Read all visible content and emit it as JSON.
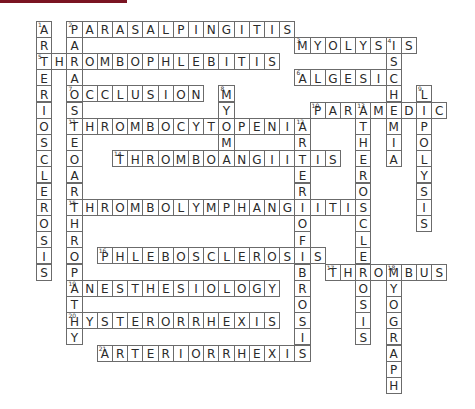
{
  "header_bar": {
    "color": "#7a1422"
  },
  "grid": {
    "origin_x": 36,
    "origin_y": 20.5,
    "cell_w": 15.2,
    "cell_h": 16.2,
    "border_color": "#6b6b6b",
    "text_color": "#2a2a2a"
  },
  "words": [
    {
      "number": 1,
      "answer": "ARTERIOSCLEROSIS",
      "direction": "down",
      "row": 0,
      "col": 0
    },
    {
      "number": 2,
      "answer": "PARASALPINGITIS",
      "direction": "across",
      "row": 0,
      "col": 2
    },
    {
      "number": 2,
      "answer": "PARAOSTEOARTHROPATHY",
      "direction": "down",
      "row": 0,
      "col": 2
    },
    {
      "number": 3,
      "answer": "MYOLYSIS",
      "direction": "across",
      "row": 1,
      "col": 17
    },
    {
      "number": 4,
      "answer": "ISCHEMIA",
      "direction": "down",
      "row": 1,
      "col": 23
    },
    {
      "number": 5,
      "answer": "THROMBOPHLEBITIS",
      "direction": "across",
      "row": 2,
      "col": 0
    },
    {
      "number": 6,
      "answer": "ALGESIC",
      "direction": "across",
      "row": 3,
      "col": 17
    },
    {
      "number": 7,
      "answer": "OCCLUSION",
      "direction": "across",
      "row": 4,
      "col": 2
    },
    {
      "number": 8,
      "answer": "MYOMA",
      "direction": "down",
      "row": 4,
      "col": 12
    },
    {
      "number": 9,
      "answer": "LIPOLYSIS",
      "direction": "down",
      "row": 4,
      "col": 25
    },
    {
      "number": 10,
      "answer": "PARAMEDIC",
      "direction": "across",
      "row": 5,
      "col": 18
    },
    {
      "number": 13,
      "answer": "ATHEROSCLEROSIS",
      "direction": "down",
      "row": 5,
      "col": 21
    },
    {
      "number": 11,
      "answer": "THROMBOCYTOPENIA",
      "direction": "across",
      "row": 6,
      "col": 2
    },
    {
      "number": 12,
      "answer": "ARTERIOFIBROSIS",
      "direction": "down",
      "row": 6,
      "col": 17
    },
    {
      "number": 14,
      "answer": "THROMBOANGIITIS",
      "direction": "across",
      "row": 8,
      "col": 5
    },
    {
      "number": 15,
      "answer": "THROMBOLYMPHANGIITIS",
      "direction": "across",
      "row": 11,
      "col": 2
    },
    {
      "number": 16,
      "answer": "PHLEBOSCLEROSIS",
      "direction": "across",
      "row": 14,
      "col": 4
    },
    {
      "number": 17,
      "answer": "THROMBUS",
      "direction": "across",
      "row": 15,
      "col": 19
    },
    {
      "number": 18,
      "answer": "MYOGRAPH",
      "direction": "down",
      "row": 15,
      "col": 23
    },
    {
      "number": 19,
      "answer": "ANESTHESIOLOGY",
      "direction": "across",
      "row": 16,
      "col": 2
    },
    {
      "number": 20,
      "answer": "HYSTERORRHEXIS",
      "direction": "across",
      "row": 18,
      "col": 2
    },
    {
      "number": 21,
      "answer": "ARTERIORRHEXIS",
      "direction": "across",
      "row": 20,
      "col": 4
    }
  ]
}
